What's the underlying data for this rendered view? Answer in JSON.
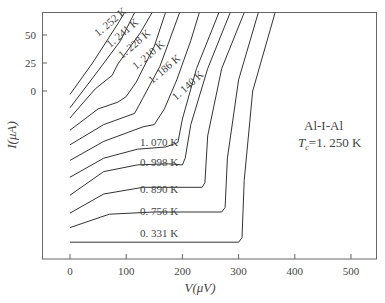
{
  "chart_data": {
    "type": "line",
    "title": "",
    "xlabel": "V(μV)",
    "ylabel": "I(μA)",
    "xlim": [
      -45,
      545
    ],
    "ylim": [
      -150,
      70
    ],
    "xticks": [
      0,
      100,
      200,
      300,
      400,
      500
    ],
    "yticks": [
      50,
      25,
      0
    ],
    "grid": false,
    "annotation": {
      "line1": "Al-I-Al",
      "line2_sym": "T",
      "line2_sub": "c",
      "line2_val": "=1. 250 K"
    },
    "note": "Curves vertically offset for clarity; I-axis values are in plotted units",
    "series": [
      {
        "name": "1. 252 K",
        "label_pos": [
          98,
          37
        ],
        "label_rot": -40,
        "points": [
          [
            0,
            -3
          ],
          [
            40,
            25
          ],
          [
            85,
            60
          ],
          [
            97,
            70
          ]
        ]
      },
      {
        "name": "1. 241 K",
        "label_pos": [
          110,
          48
        ],
        "label_rot": -40,
        "points": [
          [
            0,
            -15
          ],
          [
            50,
            18
          ],
          [
            90,
            45
          ],
          [
            115,
            70
          ]
        ]
      },
      {
        "name": "1. 228 K",
        "label_pos": [
          122,
          59
        ],
        "label_rot": -40,
        "points": [
          [
            0,
            -24
          ],
          [
            45,
            2
          ],
          [
            75,
            14
          ],
          [
            85,
            24
          ],
          [
            125,
            52
          ],
          [
            146,
            70
          ]
        ]
      },
      {
        "name": "1. 210 K",
        "label_pos": [
          136,
          70
        ],
        "label_rot": -40,
        "points": [
          [
            0,
            -35
          ],
          [
            50,
            -16
          ],
          [
            85,
            -10
          ],
          [
            100,
            -5
          ],
          [
            118,
            8
          ],
          [
            150,
            40
          ],
          [
            170,
            70
          ]
        ]
      },
      {
        "name": "1. 186 K",
        "label_pos": [
          152,
          84
        ],
        "label_rot": -40,
        "points": [
          [
            0,
            -48
          ],
          [
            60,
            -30
          ],
          [
            115,
            -20
          ],
          [
            130,
            -6
          ],
          [
            160,
            22
          ],
          [
            195,
            70
          ]
        ]
      },
      {
        "name": "1. 140 K",
        "label_pos": [
          176,
          101
        ],
        "label_rot": -42,
        "points": [
          [
            0,
            -62
          ],
          [
            60,
            -45
          ],
          [
            130,
            -32
          ],
          [
            150,
            -30
          ],
          [
            168,
            -16
          ],
          [
            190,
            10
          ],
          [
            215,
            45
          ],
          [
            230,
            70
          ]
        ]
      },
      {
        "name": "1. 070 K",
        "label_pos": [
          140,
          146
        ],
        "label_rot": 0,
        "points": [
          [
            0,
            -77
          ],
          [
            60,
            -60
          ],
          [
            120,
            -52
          ],
          [
            170,
            -50
          ],
          [
            192,
            -46
          ],
          [
            200,
            -25
          ],
          [
            225,
            20
          ],
          [
            265,
            70
          ]
        ]
      },
      {
        "name": "0. 998 K",
        "label_pos": [
          140,
          166
        ],
        "label_rot": 0,
        "points": [
          [
            0,
            -93
          ],
          [
            60,
            -72
          ],
          [
            120,
            -66
          ],
          [
            175,
            -65
          ],
          [
            200,
            -66
          ],
          [
            205,
            -60
          ],
          [
            215,
            -30
          ],
          [
            245,
            20
          ],
          [
            285,
            70
          ]
        ]
      },
      {
        "name": "0. 890 K",
        "label_pos": [
          140,
          193
        ],
        "label_rot": 0,
        "points": [
          [
            0,
            -109
          ],
          [
            60,
            -92
          ],
          [
            130,
            -86
          ],
          [
            235,
            -86
          ],
          [
            240,
            -82
          ],
          [
            245,
            -40
          ],
          [
            270,
            20
          ],
          [
            310,
            70
          ]
        ]
      },
      {
        "name": "0. 756 K",
        "label_pos": [
          140,
          215
        ],
        "label_rot": 0,
        "points": [
          [
            0,
            -122
          ],
          [
            70,
            -110
          ],
          [
            150,
            -108
          ],
          [
            270,
            -108
          ],
          [
            276,
            -104
          ],
          [
            280,
            -60
          ],
          [
            300,
            10
          ],
          [
            335,
            70
          ]
        ]
      },
      {
        "name": "0. 331 K",
        "label_pos": [
          140,
          237
        ],
        "label_rot": 0,
        "points": [
          [
            0,
            -135
          ],
          [
            300,
            -135
          ],
          [
            306,
            -131
          ],
          [
            310,
            -80
          ],
          [
            325,
            0
          ],
          [
            365,
            70
          ]
        ]
      }
    ]
  }
}
